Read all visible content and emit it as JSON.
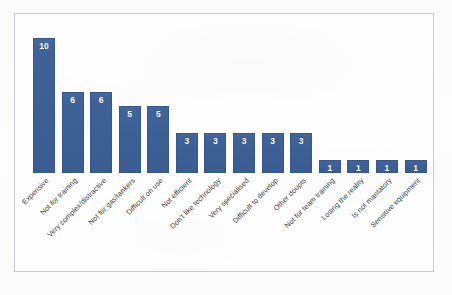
{
  "chart_data": {
    "type": "bar",
    "title": "",
    "subtitle": "",
    "xlabel": "",
    "ylabel": "",
    "ylim": [
      0,
      11
    ],
    "grid": false,
    "legend": "none",
    "axis_visible": false,
    "value_labels_inside_bars": true,
    "categories": [
      "Expensive",
      "Not for training",
      "Very complex/distractive",
      "Not for gas/tankers",
      "Difficult on use",
      "Not efficient",
      "Don't like technology",
      "Very specialised",
      "Difficult to develop",
      "Other doupts",
      "Not for team training",
      "Losing the reality",
      "Is not mantatory",
      "Sensitive equipment"
    ],
    "values": [
      10,
      6,
      6,
      5,
      5,
      3,
      3,
      3,
      3,
      3,
      1,
      1,
      1,
      1
    ],
    "series": [
      {
        "name": "Count",
        "values": [
          10,
          6,
          6,
          5,
          5,
          3,
          3,
          3,
          3,
          3,
          1,
          1,
          1,
          1
        ]
      }
    ]
  },
  "style": {
    "bar_color": "#3c5f96",
    "bar_border_color": "#36578c",
    "value_label_color": "#ffffff",
    "category_label_color": "#3f4144",
    "frame_border_color": "#c9ccd1",
    "background_color": "#fdfdfd"
  }
}
